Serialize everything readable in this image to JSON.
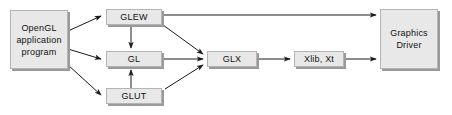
{
  "diagram": {
    "background_color": "#ffffff",
    "node_fill_color": "#e8e8e8",
    "node_border_color": "#b4b4b4",
    "node_shadow_color": "#9a9a9a",
    "edge_color": "#1a1a1a",
    "nodes": [
      {
        "id": "app",
        "label": "OpenGL\napplication\nprogram",
        "x": 10,
        "y": 10,
        "w": 58,
        "h": 59
      },
      {
        "id": "glew",
        "label": "GLEW",
        "x": 106,
        "y": 9,
        "w": 56,
        "h": 16
      },
      {
        "id": "gl",
        "label": "GL",
        "x": 106,
        "y": 51,
        "w": 56,
        "h": 16
      },
      {
        "id": "glut",
        "label": "GLUT",
        "x": 106,
        "y": 88,
        "w": 56,
        "h": 16
      },
      {
        "id": "glx",
        "label": "GLX",
        "x": 207,
        "y": 51,
        "w": 50,
        "h": 16
      },
      {
        "id": "xlib",
        "label": "Xlib, Xt",
        "x": 294,
        "y": 51,
        "w": 50,
        "h": 16
      },
      {
        "id": "driver",
        "label": "Graphics\nDriver",
        "x": 380,
        "y": 9,
        "w": 58,
        "h": 60
      }
    ],
    "edges": [
      {
        "id": "app-glew",
        "from": "app",
        "to": "glew",
        "style": "diagonal-up",
        "arrow": "end"
      },
      {
        "id": "app-gl",
        "from": "app",
        "to": "gl",
        "style": "diagonal",
        "arrow": "end"
      },
      {
        "id": "app-glut",
        "from": "app",
        "to": "glut",
        "style": "diagonal-down",
        "arrow": "end"
      },
      {
        "id": "glew-gl",
        "from": "glew",
        "to": "gl",
        "style": "vertical-down",
        "arrow": "end"
      },
      {
        "id": "glut-gl",
        "from": "glut",
        "to": "gl",
        "style": "vertical-up",
        "arrow": "end"
      },
      {
        "id": "glew-glx",
        "from": "glew",
        "to": "glx",
        "style": "diagonal-down",
        "arrow": "end"
      },
      {
        "id": "gl-glx",
        "from": "gl",
        "to": "glx",
        "style": "horizontal",
        "arrow": "end"
      },
      {
        "id": "glut-glx",
        "from": "glut",
        "to": "glx",
        "style": "diagonal-up",
        "arrow": "end"
      },
      {
        "id": "glx-xlib",
        "from": "glx",
        "to": "xlib",
        "style": "horizontal",
        "arrow": "end"
      },
      {
        "id": "xlib-driver",
        "from": "xlib",
        "to": "driver",
        "style": "horizontal",
        "arrow": "end"
      },
      {
        "id": "glew-driver",
        "from": "glew",
        "to": "driver",
        "style": "horizontal",
        "arrow": "end"
      }
    ]
  }
}
